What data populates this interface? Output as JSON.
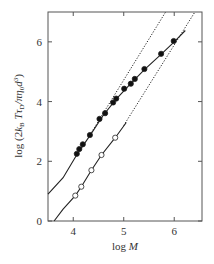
{
  "chart_data": {
    "type": "scatter",
    "title": "",
    "xlabel": "log M",
    "ylabel": "log (2k_B T τ_D / πη_0 d^3)",
    "xlim": [
      3.5,
      6.55
    ],
    "ylim": [
      0,
      7
    ],
    "xticks": [
      4,
      5,
      6
    ],
    "yticks": [
      0,
      2,
      4,
      6
    ],
    "grid": false,
    "legend": null,
    "series": [
      {
        "name": "filled circles",
        "marker": "filled-circle",
        "x": [
          4.07,
          4.12,
          4.19,
          4.33,
          4.52,
          4.63,
          4.79,
          4.85,
          5.01,
          5.14,
          5.22,
          5.41,
          5.74,
          5.99
        ],
        "y": [
          2.25,
          2.41,
          2.57,
          2.88,
          3.42,
          3.61,
          3.97,
          4.1,
          4.43,
          4.6,
          4.76,
          5.09,
          5.6,
          6.03
        ]
      },
      {
        "name": "open circles",
        "marker": "open-circle",
        "x": [
          4.04,
          4.16,
          4.36,
          4.56,
          4.83
        ],
        "y": [
          0.85,
          1.15,
          1.7,
          2.21,
          2.79
        ]
      }
    ],
    "lines": [
      {
        "name": "upper solid fit",
        "style": "solid",
        "points": [
          [
            3.5,
            0.9
          ],
          [
            3.8,
            1.45
          ],
          [
            4.07,
            2.22
          ],
          [
            4.33,
            2.86
          ],
          [
            4.6,
            3.55
          ],
          [
            4.85,
            4.08
          ],
          [
            5.1,
            4.53
          ],
          [
            5.4,
            5.05
          ],
          [
            5.75,
            5.6
          ],
          [
            6.0,
            6.0
          ],
          [
            6.22,
            6.38
          ]
        ]
      },
      {
        "name": "upper dotted asymptote",
        "style": "dotted",
        "points": [
          [
            4.3,
            2.8
          ],
          [
            5.83,
            7.0
          ]
        ]
      },
      {
        "name": "lower solid fit",
        "style": "solid",
        "points": [
          [
            3.62,
            0.0
          ],
          [
            3.8,
            0.4
          ],
          [
            4.04,
            0.85
          ],
          [
            4.16,
            1.15
          ],
          [
            4.36,
            1.7
          ],
          [
            4.56,
            2.21
          ],
          [
            4.83,
            2.79
          ],
          [
            5.05,
            3.3
          ]
        ]
      },
      {
        "name": "lower dotted asymptote",
        "style": "dotted",
        "points": [
          [
            5.0,
            3.2
          ],
          [
            6.41,
            7.0
          ]
        ]
      }
    ]
  }
}
